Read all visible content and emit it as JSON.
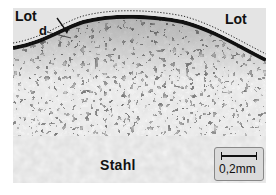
{
  "image": {
    "description": "Black and white micrograph of a solder (Lot) / steel (Stahl) interface with a dark diffusion zone",
    "labels": {
      "lot_left": "Lot",
      "d_marker": "d",
      "lot_right": "Lot",
      "stahl": "Stahl"
    },
    "scale_bar": {
      "text": "0,2mm"
    }
  }
}
